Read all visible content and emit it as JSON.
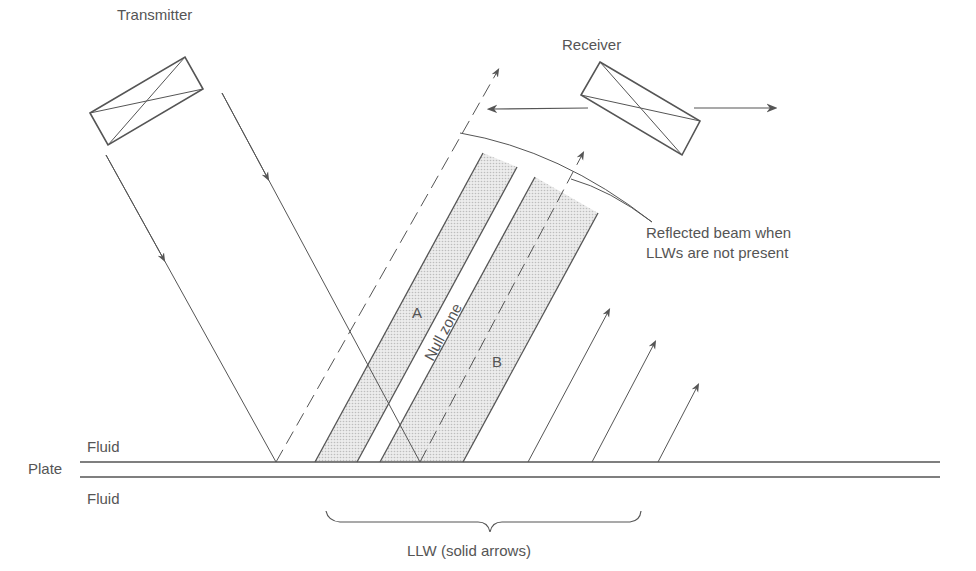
{
  "diagram": {
    "labels": {
      "transmitter": "Transmitter",
      "receiver": "Receiver",
      "reflected_line1": "Reflected beam when",
      "reflected_line2": "LLWs are not present",
      "fluid_top": "Fluid",
      "plate": "Plate",
      "fluid_bottom": "Fluid",
      "zone_a": "A",
      "zone_b": "B",
      "null_zone": "Null zone",
      "llw_caption": "LLW (solid arrows)"
    },
    "colors": {
      "line": "#555555",
      "shade": "#d8d8d8",
      "background": "#ffffff"
    }
  }
}
